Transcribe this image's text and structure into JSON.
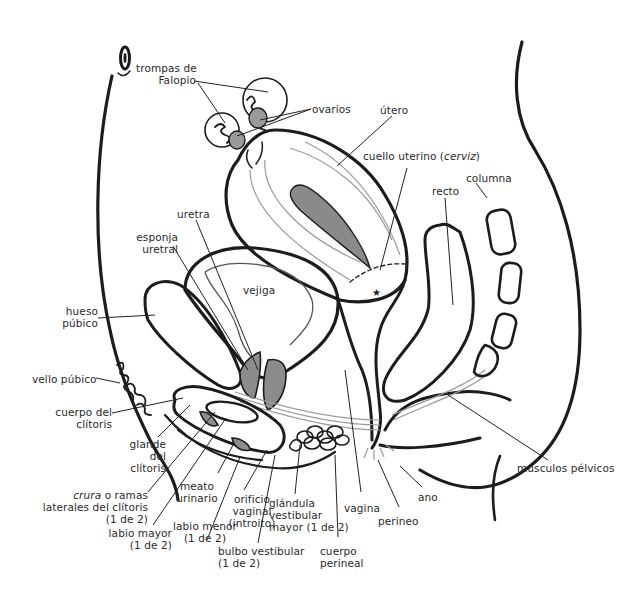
{
  "diagram": {
    "labels": {
      "trompas": [
        "trompas de",
        "Falopio"
      ],
      "ovarios": "ovarios",
      "utero": "útero",
      "cuello": "cuello uterino (",
      "cuello_it": "cerviz",
      "cuello_end": ")",
      "columna": "columna",
      "recto": "recto",
      "uretra": "uretra",
      "esponja": [
        "esponja",
        "uretral"
      ],
      "vejiga": "vejiga",
      "hueso": [
        "hueso",
        "púbico"
      ],
      "vello": "vello púbico",
      "cuerpo_clitoris": [
        "cuerpo del",
        "clítoris"
      ],
      "glande": [
        "glande",
        "del",
        "clítoris"
      ],
      "crura_it": "crura",
      "crura": [
        " o ramas",
        "laterales del clítoris",
        "(1 de 2)"
      ],
      "labio_mayor": [
        "labio mayor",
        "(1 de 2)"
      ],
      "meato": [
        "meato",
        "urinario"
      ],
      "labio_menor": [
        "labio menor",
        "(1 de 2)"
      ],
      "orificio": [
        "orificio",
        "vaginal",
        "(introito)"
      ],
      "bulbo": [
        "bulbo vestibular",
        "(1 de 2)"
      ],
      "glandula": [
        "glándula",
        "vestibular",
        "mayor (1 de 2)"
      ],
      "cuerpo_perineal": [
        "cuerpo",
        "perineal"
      ],
      "vagina": "vagina",
      "perineo": "perineo",
      "ano": "ano",
      "musculos": "músculos pélvicos"
    }
  }
}
